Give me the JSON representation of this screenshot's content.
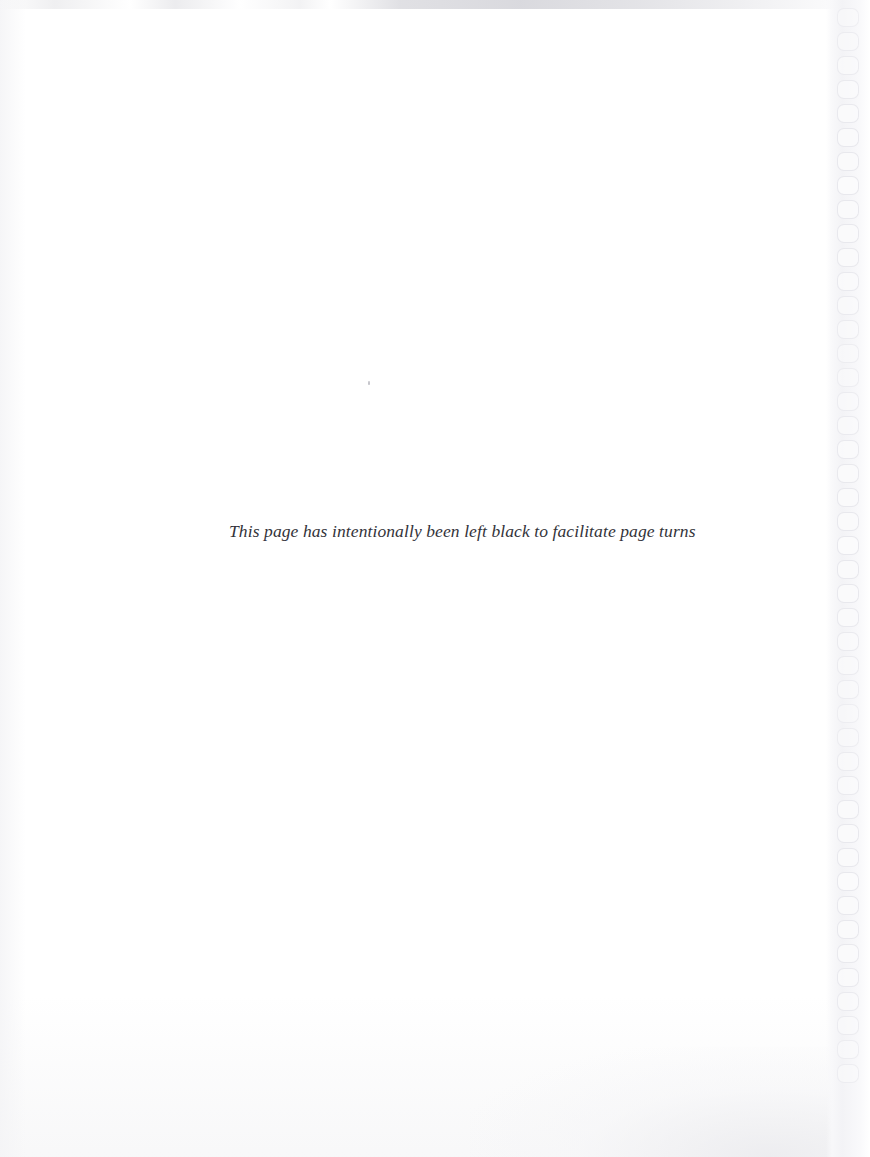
{
  "page": {
    "width": 870,
    "height": 1157,
    "background_color": "#ffffff",
    "kind": "scanned-book-page"
  },
  "notice": {
    "text": "This page has intentionally been left black to facilitate page turns",
    "color": "#33333a",
    "style": "italic-serif"
  },
  "binding": {
    "edge": "right",
    "hole_count": 45,
    "first_hole_top": 8,
    "hole_pitch": 24,
    "hole_width": 22,
    "hole_height": 19,
    "hole_border_color": "#e7e7ec",
    "strip_color": "#f3f3f6"
  },
  "artifacts": {
    "top_smudge_color": "#d0d0d6",
    "bottom_wash_color": "#ebebee",
    "speck_color": "#b2b2ba"
  }
}
